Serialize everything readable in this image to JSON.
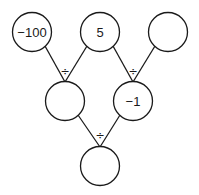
{
  "diagram": {
    "type": "division-pyramid",
    "operator": "÷",
    "nodes": [
      {
        "id": "top-left",
        "value": "−100",
        "cx": 32,
        "cy": 32
      },
      {
        "id": "top-middle",
        "value": "5",
        "cx": 100,
        "cy": 32
      },
      {
        "id": "top-right",
        "value": "",
        "cx": 168,
        "cy": 32
      },
      {
        "id": "middle-left",
        "value": "",
        "cx": 65,
        "cy": 101
      },
      {
        "id": "middle-right",
        "value": "−1",
        "cx": 133,
        "cy": 101
      },
      {
        "id": "bottom",
        "value": "",
        "cx": 100,
        "cy": 166
      }
    ],
    "operators": [
      {
        "id": "op-middle-left",
        "symbol": "÷"
      },
      {
        "id": "op-middle-right",
        "symbol": "÷"
      },
      {
        "id": "op-bottom",
        "symbol": "÷"
      }
    ],
    "colors": {
      "stroke": "#1a1a1a",
      "fill": "#ffffff"
    }
  }
}
